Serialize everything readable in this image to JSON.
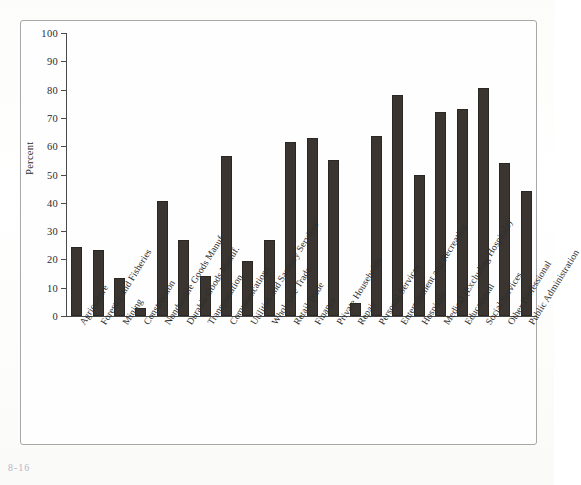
{
  "figure": {
    "number": "8-16",
    "y_axis_label": "Percent"
  },
  "chart_data": {
    "type": "bar",
    "title": "",
    "subtitle": "",
    "xlabel": "",
    "ylabel": "Percent",
    "ylim": [
      0,
      100
    ],
    "yticks": [
      0,
      10,
      20,
      30,
      40,
      50,
      60,
      70,
      80,
      90,
      100
    ],
    "grid": false,
    "legend": null,
    "bar_color": "#3a3530",
    "categories": [
      "Agriculture",
      "Forestry and Fisheries",
      "Mining",
      "Construction",
      "Nondurable Goods Manuf.",
      "Durable Goods Manuf.",
      "Transportation",
      "Communications",
      "Utilities and Sanitary Services",
      "Wholesale Trade",
      "Retail Trade",
      "Finance",
      "Private Households",
      "Repair",
      "Personal Services",
      "Entertainment and Recreation",
      "Hospitals",
      "Medical (Excluding Hospitals)",
      "Educational",
      "Social Services",
      "Other Professional",
      "Public Administration"
    ],
    "values": [
      24.5,
      23.5,
      13.5,
      3.0,
      40.5,
      27.0,
      14.0,
      56.5,
      19.5,
      27.0,
      61.5,
      63.0,
      55.0,
      4.5,
      63.5,
      78.0,
      50.0,
      72.0,
      73.0,
      80.5,
      54.0,
      44.0
    ]
  }
}
